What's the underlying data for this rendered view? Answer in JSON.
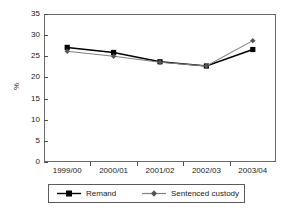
{
  "chart_data": {
    "type": "line",
    "title": "",
    "subtitle": "",
    "xlabel": "",
    "ylabel": "%",
    "categories": [
      "1999/00",
      "2000/01",
      "2001/02",
      "2002/03",
      "2003/04"
    ],
    "series": [
      {
        "name": "Remand",
        "color": "#000000",
        "marker": "square",
        "values": [
          27.1,
          25.9,
          23.7,
          22.7,
          26.6
        ]
      },
      {
        "name": "Sentenced custody",
        "color": "#808080",
        "marker": "diamond",
        "values": [
          26.2,
          25.0,
          23.6,
          22.7,
          28.7
        ]
      }
    ],
    "ylim": [
      0,
      35
    ],
    "yticks": [
      0,
      5,
      10,
      15,
      20,
      25,
      30,
      35
    ],
    "ytick_labels": [
      "0",
      "5",
      "10",
      "15",
      "20",
      "25",
      "30",
      "35"
    ],
    "grid": false,
    "legend_position": "bottom"
  },
  "axes": {
    "y_title": "%",
    "y_ticks": [
      "35",
      "30",
      "25",
      "20",
      "15",
      "10",
      "5",
      "0"
    ],
    "x_ticks": [
      "1999/00",
      "2000/01",
      "2001/02",
      "2002/03",
      "2003/04"
    ]
  },
  "legend": {
    "items": [
      {
        "label": "Remand",
        "color": "#000000"
      },
      {
        "label": "Sentenced custody",
        "color": "#808080"
      }
    ]
  },
  "colors": {
    "remand": "#000000",
    "sentenced_custody": "#808080",
    "frame": "#6b6b6b",
    "text": "#1a1a1a",
    "background": "#ffffff"
  }
}
